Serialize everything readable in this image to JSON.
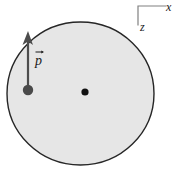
{
  "figure": {
    "background_color": "#ffffff",
    "width": 180,
    "height": 173
  },
  "disk": {
    "name": "charged-disk",
    "fill_color": "#e6e6e6",
    "stroke_color": "#262626",
    "stroke_width": 1.4,
    "center_x": 80.5,
    "center_y": 93.5,
    "radius_x": 73.5,
    "radius_y": 71.5
  },
  "center_dot": {
    "name": "disk-center-dot",
    "x": 85,
    "y": 92,
    "radius": 3.6,
    "color": "#121212"
  },
  "dipole": {
    "label": "p",
    "vector_accent": "arrow",
    "shaft_color": "#4d4d4d",
    "shaft_width": 2.2,
    "tail_x": 28,
    "tail_y": 90,
    "tip_x": 28,
    "tip_y": 33,
    "arrowhead_color": "#4d4d4d",
    "point_charge": {
      "name": "dipole-point-charge",
      "x": 28,
      "y": 90,
      "radius": 5.2,
      "color": "#4a4a4a"
    }
  },
  "axes": {
    "corner_x": 138,
    "corner_y": 6,
    "horizontal_end_x": 166,
    "vertical_end_y": 25,
    "stroke_color": "#808080",
    "stroke_width": 1.2,
    "x_label": "x",
    "z_label": "z"
  }
}
